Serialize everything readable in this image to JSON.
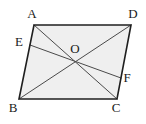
{
  "figure": {
    "shape_type": "parallelogram",
    "background_color": "#ffffff",
    "fill_color": "#efefef",
    "stroke_color": "#1f1f1f",
    "interior_stroke_color": "#4a4a4a",
    "label_color": "#1a1a1a",
    "outline_width": 1.6,
    "interior_width": 1.0,
    "vertices": {
      "A": {
        "label": "A",
        "x": 34,
        "y": 25,
        "label_x": 32,
        "label_y": 15
      },
      "D": {
        "label": "D",
        "x": 131,
        "y": 25,
        "label_x": 133,
        "label_y": 15
      },
      "B": {
        "label": "B",
        "x": 19,
        "y": 99,
        "label_x": 13,
        "label_y": 109
      },
      "C": {
        "label": "C",
        "x": 117,
        "y": 99,
        "label_x": 116,
        "label_y": 109
      }
    },
    "points": {
      "O": {
        "label": "O",
        "x": 75,
        "y": 62,
        "label_x": 75,
        "label_y": 50,
        "description": "intersection of diagonals"
      },
      "E": {
        "label": "E",
        "x": 30,
        "y": 45,
        "label_x": 19,
        "label_y": 43,
        "description": "point on side AB"
      },
      "F": {
        "label": "F",
        "x": 121,
        "y": 78,
        "label_x": 127,
        "label_y": 79,
        "description": "point on side DC"
      }
    },
    "outline_path": "M 34 25 L 131 25 L 117 99 L 19 99 Z",
    "segments": [
      {
        "name": "diagonal-AC",
        "from": "A",
        "to": "C",
        "x1": 34,
        "y1": 25,
        "x2": 117,
        "y2": 99
      },
      {
        "name": "diagonal-BD",
        "from": "B",
        "to": "D",
        "x1": 19,
        "y1": 99,
        "x2": 131,
        "y2": 25
      },
      {
        "name": "segment-EF",
        "from": "E",
        "to": "F",
        "x1": 30,
        "y1": 45,
        "x2": 121,
        "y2": 78
      }
    ],
    "sides": [
      {
        "name": "side-AD",
        "from": "A",
        "to": "D"
      },
      {
        "name": "side-DC",
        "from": "D",
        "to": "C"
      },
      {
        "name": "side-CB",
        "from": "C",
        "to": "B"
      },
      {
        "name": "side-BA",
        "from": "B",
        "to": "A"
      }
    ]
  }
}
